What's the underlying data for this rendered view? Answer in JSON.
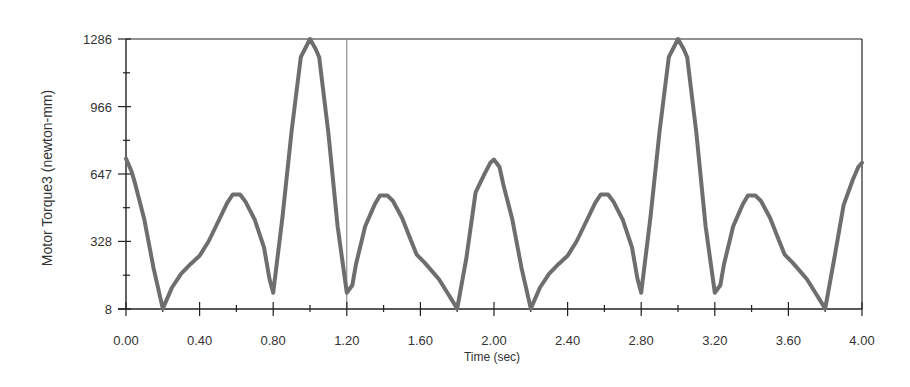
{
  "chart_data": {
    "type": "line",
    "title": "",
    "xlabel": "Time (sec)",
    "ylabel": "Motor Torque3 (newton-mm)",
    "xlim": [
      0,
      4.0
    ],
    "ylim": [
      8,
      1286
    ],
    "grid": false,
    "legend": "none",
    "line_color": "#6e6e6e",
    "axis_color": "#222222",
    "cursor_line_x": 1.2,
    "x_ticks": [
      {
        "value": 0.0,
        "label": "0.00"
      },
      {
        "value": 0.4,
        "label": "0.40"
      },
      {
        "value": 0.8,
        "label": "0.80"
      },
      {
        "value": 1.2,
        "label": "1.20"
      },
      {
        "value": 1.6,
        "label": "1.60"
      },
      {
        "value": 2.0,
        "label": "2.00"
      },
      {
        "value": 2.4,
        "label": "2.40"
      },
      {
        "value": 2.8,
        "label": "2.80"
      },
      {
        "value": 3.2,
        "label": "3.20"
      },
      {
        "value": 3.6,
        "label": "3.60"
      },
      {
        "value": 4.0,
        "label": "4.00"
      }
    ],
    "x_minor_ticks": [
      0.2,
      0.6,
      1.0,
      1.4,
      1.8,
      2.2,
      2.6,
      3.0,
      3.4,
      3.8
    ],
    "y_ticks": [
      {
        "value": 8,
        "label": "8"
      },
      {
        "value": 328,
        "label": "328"
      },
      {
        "value": 647,
        "label": "647"
      },
      {
        "value": 966,
        "label": "966"
      },
      {
        "value": 1286,
        "label": "1286"
      }
    ],
    "y_minor_ticks": [
      168,
      487.5,
      806.5,
      1126
    ],
    "series": [
      {
        "name": "Motor Torque3",
        "x": [
          0.0,
          0.03,
          0.05,
          0.1,
          0.15,
          0.2,
          0.25,
          0.3,
          0.35,
          0.4,
          0.45,
          0.5,
          0.55,
          0.58,
          0.62,
          0.65,
          0.7,
          0.75,
          0.78,
          0.8,
          0.85,
          0.9,
          0.95,
          1.0,
          1.03,
          1.05,
          1.1,
          1.15,
          1.2,
          1.23,
          1.25,
          1.3,
          1.35,
          1.38,
          1.42,
          1.45,
          1.5,
          1.55,
          1.58,
          1.62,
          1.65,
          1.7,
          1.75,
          1.8,
          1.85,
          1.9,
          1.95,
          1.98,
          2.0,
          2.03,
          2.05,
          2.1,
          2.15,
          2.2,
          2.25,
          2.3,
          2.35,
          2.4,
          2.45,
          2.5,
          2.55,
          2.58,
          2.62,
          2.65,
          2.7,
          2.75,
          2.78,
          2.8,
          2.85,
          2.9,
          2.95,
          3.0,
          3.03,
          3.05,
          3.1,
          3.15,
          3.2,
          3.23,
          3.25,
          3.3,
          3.35,
          3.38,
          3.42,
          3.45,
          3.5,
          3.55,
          3.58,
          3.62,
          3.65,
          3.7,
          3.75,
          3.8,
          3.85,
          3.9,
          3.95,
          3.98,
          4.0
        ],
        "y": [
          720,
          660,
          600,
          430,
          200,
          10,
          110,
          175,
          220,
          260,
          330,
          420,
          510,
          550,
          550,
          515,
          430,
          300,
          150,
          85,
          440,
          850,
          1200,
          1286,
          1240,
          1200,
          840,
          400,
          85,
          120,
          220,
          400,
          500,
          545,
          545,
          520,
          440,
          330,
          265,
          230,
          200,
          150,
          80,
          10,
          250,
          560,
          650,
          700,
          715,
          680,
          600,
          430,
          200,
          10,
          110,
          175,
          220,
          260,
          330,
          420,
          510,
          550,
          550,
          515,
          430,
          300,
          150,
          85,
          440,
          850,
          1200,
          1286,
          1240,
          1200,
          840,
          400,
          85,
          120,
          220,
          400,
          500,
          545,
          545,
          520,
          440,
          330,
          265,
          230,
          200,
          150,
          80,
          10,
          250,
          500,
          620,
          680,
          700
        ]
      }
    ]
  }
}
